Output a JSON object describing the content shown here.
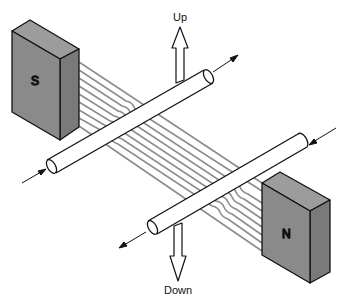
{
  "diagram": {
    "type": "physics-illustration",
    "labels": {
      "up": "Up",
      "down": "Down",
      "south_pole": "S",
      "north_pole": "N"
    },
    "elements": [
      {
        "id": "south-magnet",
        "label": "S"
      },
      {
        "id": "north-magnet",
        "label": "N"
      },
      {
        "id": "upper-conductor",
        "current_direction": "up-right",
        "force": "Up"
      },
      {
        "id": "lower-conductor",
        "current_direction": "down-left",
        "force": "Down"
      },
      {
        "id": "field-lines",
        "count": 9,
        "direction": "S to N"
      }
    ],
    "colors": {
      "magnet_front": "#8a8a8a",
      "magnet_top": "#9c9c9c",
      "magnet_side": "#7a7a7a",
      "field_line": "#8c8c8c",
      "outline": "#111111"
    }
  }
}
